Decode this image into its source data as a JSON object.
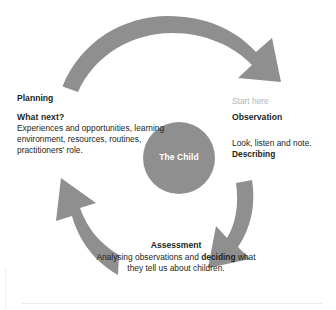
{
  "diagram": {
    "center": {
      "label": "The Child"
    },
    "colors": {
      "arrow_gray": "#8f8f8f",
      "circle_gray": "#8f8f8f",
      "text_dark": "#231f20",
      "muted_gray": "#b4b4b4",
      "background": "#ffffff"
    },
    "stages": {
      "planning": {
        "heading": "Planning",
        "subheading": "What next?",
        "body": "Experiences and opportunities, learning environment, resources, routines, practitioners' role."
      },
      "observation": {
        "start_label": "Start here",
        "heading": "Observation",
        "body": "Look, listen and note.",
        "emphasis": "Describing"
      },
      "assessment": {
        "heading": "Assessment",
        "body_before": "Analysing observations and ",
        "emphasis": "deciding",
        "body_after": " what they tell us about children."
      }
    },
    "arrows": [
      {
        "name": "arrow-planning-to-observation",
        "direction": "clockwise-top"
      },
      {
        "name": "arrow-observation-to-assessment",
        "direction": "clockwise-right"
      },
      {
        "name": "arrow-assessment-to-planning",
        "direction": "clockwise-left"
      }
    ]
  }
}
